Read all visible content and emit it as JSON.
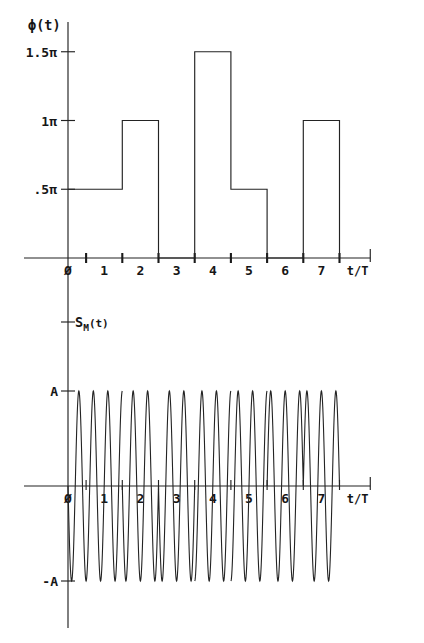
{
  "figure": {
    "background_color": "#ffffff",
    "ink_color": "#232323"
  },
  "chart_data": [
    {
      "id": "phase-plot",
      "type": "line",
      "subtype": "step",
      "title": "",
      "ylabel": "ϕ(t)",
      "xlabel": "t/T",
      "ytick_labels": [
        "1.5π",
        "1π",
        ".5π"
      ],
      "ytick_values": [
        1.5,
        1.0,
        0.5
      ],
      "ylim": [
        0,
        1.75
      ],
      "xlim": [
        -0.55,
        8.35
      ],
      "xtick_labels": [
        "Ø",
        "1",
        "2",
        "3",
        "4",
        "5",
        "6",
        "7"
      ],
      "xtick_label_values": [
        0,
        1,
        2,
        3,
        4,
        5,
        6,
        7
      ],
      "xtick_marks_at": [
        0.5,
        1.5,
        2.5,
        3.5,
        4.5,
        5.5,
        6.5,
        7.5
      ],
      "grid": false,
      "legend": false,
      "symbol_boundaries": [
        0,
        1.5,
        2.5,
        3.5,
        4.5,
        5.5,
        6.5,
        7.5
      ],
      "step_segments": [
        {
          "x_start": 0.0,
          "x_end": 1.5,
          "value": 0.5,
          "label": ".5π"
        },
        {
          "x_start": 1.5,
          "x_end": 2.5,
          "value": 1.0,
          "label": "1π"
        },
        {
          "x_start": 2.5,
          "x_end": 3.5,
          "value": 0.0,
          "label": "0"
        },
        {
          "x_start": 3.5,
          "x_end": 4.5,
          "value": 1.5,
          "label": "1.5π"
        },
        {
          "x_start": 4.5,
          "x_end": 5.5,
          "value": 0.5,
          "label": ".5π"
        },
        {
          "x_start": 5.5,
          "x_end": 6.5,
          "value": 0.0,
          "label": "0"
        },
        {
          "x_start": 6.5,
          "x_end": 7.5,
          "value": 1.0,
          "label": "1π"
        }
      ]
    },
    {
      "id": "signal-plot",
      "type": "line",
      "subtype": "waveform",
      "title": "",
      "ylabel": "S_M(t)",
      "ylabel_main": "S",
      "ylabel_subscript": "M",
      "ylabel_tail": "(t)",
      "xlabel": "t/T",
      "ytick_labels": [
        "A",
        "-A"
      ],
      "ytick_values": [
        1,
        -1
      ],
      "ylim": [
        -1.35,
        1.35
      ],
      "xlim": [
        -0.55,
        8.35
      ],
      "xtick_labels": [
        "Ø",
        "1",
        "2",
        "3",
        "4",
        "5",
        "6",
        "7"
      ],
      "xtick_label_values": [
        0,
        1,
        2,
        3,
        4,
        5,
        6,
        7
      ],
      "xtick_marks_at": [
        0.5,
        1.5,
        2.5,
        3.5,
        4.5,
        5.5,
        6.5,
        7.5
      ],
      "grid": false,
      "legend": false,
      "amplitude": 1.0,
      "cycles_per_symbol": 2.5,
      "equation": "S_M(t) = A cos(2π f t + ϕ(t))",
      "phase_segments": [
        {
          "x_start": 0.0,
          "x_end": 1.5,
          "phase_pi": 0.5
        },
        {
          "x_start": 1.5,
          "x_end": 2.5,
          "phase_pi": 1.0
        },
        {
          "x_start": 2.5,
          "x_end": 3.5,
          "phase_pi": 0.0
        },
        {
          "x_start": 3.5,
          "x_end": 4.5,
          "phase_pi": 1.5
        },
        {
          "x_start": 4.5,
          "x_end": 5.5,
          "phase_pi": 0.5
        },
        {
          "x_start": 5.5,
          "x_end": 6.5,
          "phase_pi": 0.0
        },
        {
          "x_start": 6.5,
          "x_end": 7.5,
          "phase_pi": 1.0
        }
      ]
    }
  ]
}
